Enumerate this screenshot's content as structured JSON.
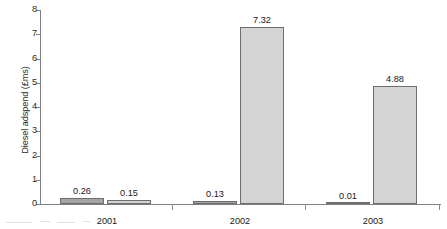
{
  "chart_data": {
    "type": "bar",
    "title": "",
    "xlabel": "",
    "ylabel": "Diesel adspend (£ms)",
    "categories": [
      "2001",
      "2002",
      "2003"
    ],
    "series": [
      {
        "name": "series-1",
        "color": "#a5a5a5",
        "values": [
          0.26,
          0.13,
          0.01
        ]
      },
      {
        "name": "series-2",
        "color": "#d4d4d4",
        "values": [
          0.15,
          7.32,
          4.88
        ]
      }
    ],
    "value_labels": [
      [
        "0.26",
        "0.13",
        "0.01"
      ],
      [
        "0.15",
        "7.32",
        "4.88"
      ]
    ],
    "ylim": [
      0,
      8
    ],
    "yticks": [
      0,
      1,
      2,
      3,
      4,
      5,
      6,
      7,
      8
    ],
    "ytick_labels": [
      "0",
      "1",
      "2",
      "3",
      "4",
      "5",
      "6",
      "7",
      "8"
    ],
    "grid": false,
    "legend": "none"
  },
  "axes": {
    "y_axis_name": "y-axis",
    "x_axis_name": "x-axis"
  }
}
